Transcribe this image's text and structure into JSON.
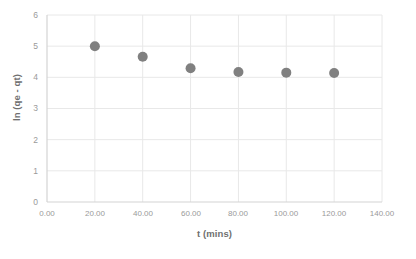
{
  "chart_data": {
    "type": "scatter",
    "title": "",
    "xlabel": "t (mins)",
    "ylabel": "ln (qe - qt)",
    "xlim": [
      0,
      140
    ],
    "ylim": [
      0,
      6
    ],
    "xticks": [
      "0.00",
      "20.00",
      "40.00",
      "60.00",
      "80.00",
      "100.00",
      "120.00",
      "140.00"
    ],
    "xtick_values": [
      0,
      20,
      40,
      60,
      80,
      100,
      120,
      140
    ],
    "yticks": [
      "0",
      "1",
      "2",
      "3",
      "4",
      "5",
      "6"
    ],
    "ytick_values": [
      0,
      1,
      2,
      3,
      4,
      5,
      6
    ],
    "grid": true,
    "grid_axis": "both",
    "legend": false,
    "legend_position": "none",
    "marker": "circle",
    "marker_color": "#808080",
    "marker_size": 5,
    "x": [
      20,
      40,
      60,
      80,
      100,
      120
    ],
    "y": [
      5.0,
      4.66,
      4.29,
      4.17,
      4.15,
      4.14
    ],
    "points": [
      {
        "x": 20,
        "y": 5.0
      },
      {
        "x": 40,
        "y": 4.66
      },
      {
        "x": 60,
        "y": 4.29
      },
      {
        "x": 80,
        "y": 4.17
      },
      {
        "x": 100,
        "y": 4.15
      },
      {
        "x": 120,
        "y": 4.14
      }
    ]
  },
  "colors": {
    "marker": "#808080",
    "grid": "#e8e8e8",
    "axis": "#d4d4d4",
    "tick_text": "#9a9a9a",
    "title_text": "#6f6f6f",
    "background": "#ffffff"
  },
  "caption": {
    "text": ""
  }
}
